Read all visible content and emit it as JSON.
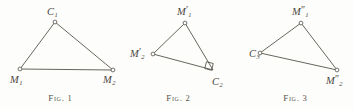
{
  "plate": {
    "background_color": "#fdfdfb",
    "ink_color": "#56534c",
    "figures": [
      {
        "id": "figure-1",
        "caption_prefix": "Fig. ",
        "caption_number": "1",
        "vertices": [
          {
            "name": "apex",
            "base": "C",
            "prime": "",
            "sub": "1",
            "x": 55,
            "y": 22
          },
          {
            "name": "bottom-left",
            "base": "M",
            "prime": "",
            "sub": "1",
            "x": 20,
            "y": 69
          },
          {
            "name": "bottom-right",
            "base": "M",
            "prime": "",
            "sub": "2",
            "x": 113,
            "y": 70
          }
        ],
        "label_positions": [
          {
            "x": 47,
            "y": 4
          },
          {
            "x": 10,
            "y": 72
          },
          {
            "x": 103,
            "y": 72
          }
        ],
        "right_angle_at": null
      },
      {
        "id": "figure-2",
        "caption_prefix": "Fig. ",
        "caption_number": "2",
        "vertices": [
          {
            "name": "apex",
            "base": "M",
            "prime": "′",
            "sub": "1",
            "x": 65,
            "y": 23
          },
          {
            "name": "left",
            "base": "M",
            "prime": "′",
            "sub": "2",
            "x": 33,
            "y": 54
          },
          {
            "name": "bottom-right",
            "base": "C",
            "prime": "",
            "sub": "2",
            "x": 93,
            "y": 70
          }
        ],
        "label_positions": [
          {
            "x": 57,
            "y": 4
          },
          {
            "x": 10,
            "y": 46
          },
          {
            "x": 92,
            "y": 74
          }
        ],
        "right_angle_at": "bottom-right"
      },
      {
        "id": "figure-3",
        "caption_prefix": "Fig. ",
        "caption_number": "3",
        "vertices": [
          {
            "name": "apex",
            "base": "M",
            "prime": "″",
            "sub": "1",
            "x": 65,
            "y": 23
          },
          {
            "name": "left",
            "base": "C",
            "prime": "",
            "sub": "3",
            "x": 24,
            "y": 53
          },
          {
            "name": "bottom-right",
            "base": "M",
            "prime": "″",
            "sub": "2",
            "x": 101,
            "y": 70
          }
        ],
        "label_positions": [
          {
            "x": 56,
            "y": 4
          },
          {
            "x": 13,
            "y": 46
          },
          {
            "x": 90,
            "y": 73
          }
        ],
        "right_angle_at": null
      }
    ]
  }
}
